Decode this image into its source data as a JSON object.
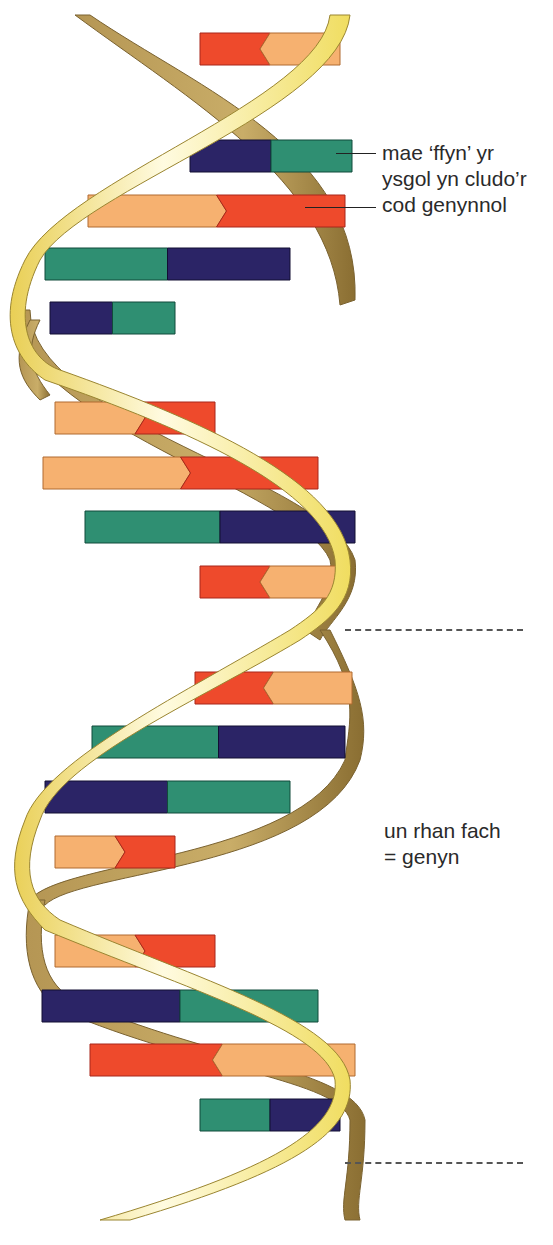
{
  "labels": {
    "rung_note_line1": "mae ‘ffyn’ yr",
    "rung_note_line2": "ysgol yn cludo’r",
    "rung_note_line3": "cod genynnol",
    "gene_note_line1": "un rhan fach",
    "gene_note_line2": "= genyn"
  },
  "colors": {
    "backbone_front": "#f2e27a",
    "backbone_back": "#a88a48",
    "base_orange": "#f6b170",
    "base_red": "#ee4a2c",
    "base_green": "#2f8f72",
    "base_navy": "#2b2466"
  },
  "rungs": [
    {
      "y": 33,
      "x1": 200,
      "x2": 340,
      "left": "red",
      "right": "orange",
      "shape": "arrow-left"
    },
    {
      "y": 140,
      "x1": 190,
      "x2": 352,
      "left": "navy",
      "right": "green",
      "shape": "flat"
    },
    {
      "y": 195,
      "x1": 88,
      "x2": 345,
      "left": "orange",
      "right": "red",
      "shape": "arrow-right"
    },
    {
      "y": 248,
      "x1": 45,
      "x2": 290,
      "left": "green",
      "right": "navy",
      "shape": "flat"
    },
    {
      "y": 302,
      "x1": 50,
      "x2": 175,
      "left": "navy",
      "right": "green",
      "shape": "flat"
    },
    {
      "y": 402,
      "x1": 55,
      "x2": 215,
      "left": "orange",
      "right": "red",
      "shape": "arrow-right"
    },
    {
      "y": 457,
      "x1": 43,
      "x2": 318,
      "left": "orange",
      "right": "red",
      "shape": "arrow-right"
    },
    {
      "y": 511,
      "x1": 85,
      "x2": 355,
      "left": "green",
      "right": "navy",
      "shape": "flat"
    },
    {
      "y": 566,
      "x1": 200,
      "x2": 340,
      "left": "red",
      "right": "orange",
      "shape": "arrow-left"
    },
    {
      "y": 672,
      "x1": 195,
      "x2": 352,
      "left": "red",
      "right": "orange",
      "shape": "arrow-left"
    },
    {
      "y": 726,
      "x1": 92,
      "x2": 345,
      "left": "green",
      "right": "navy",
      "shape": "flat"
    },
    {
      "y": 781,
      "x1": 45,
      "x2": 290,
      "left": "navy",
      "right": "green",
      "shape": "flat"
    },
    {
      "y": 836,
      "x1": 55,
      "x2": 175,
      "left": "orange",
      "right": "red",
      "shape": "arrow-right"
    },
    {
      "y": 935,
      "x1": 55,
      "x2": 215,
      "left": "orange",
      "right": "red",
      "shape": "arrow-right"
    },
    {
      "y": 990,
      "x1": 42,
      "x2": 318,
      "left": "navy",
      "right": "green",
      "shape": "flat"
    },
    {
      "y": 1044,
      "x1": 90,
      "x2": 355,
      "left": "red",
      "right": "orange",
      "shape": "arrow-left"
    },
    {
      "y": 1099,
      "x1": 200,
      "x2": 340,
      "left": "green",
      "right": "navy",
      "shape": "flat"
    }
  ]
}
